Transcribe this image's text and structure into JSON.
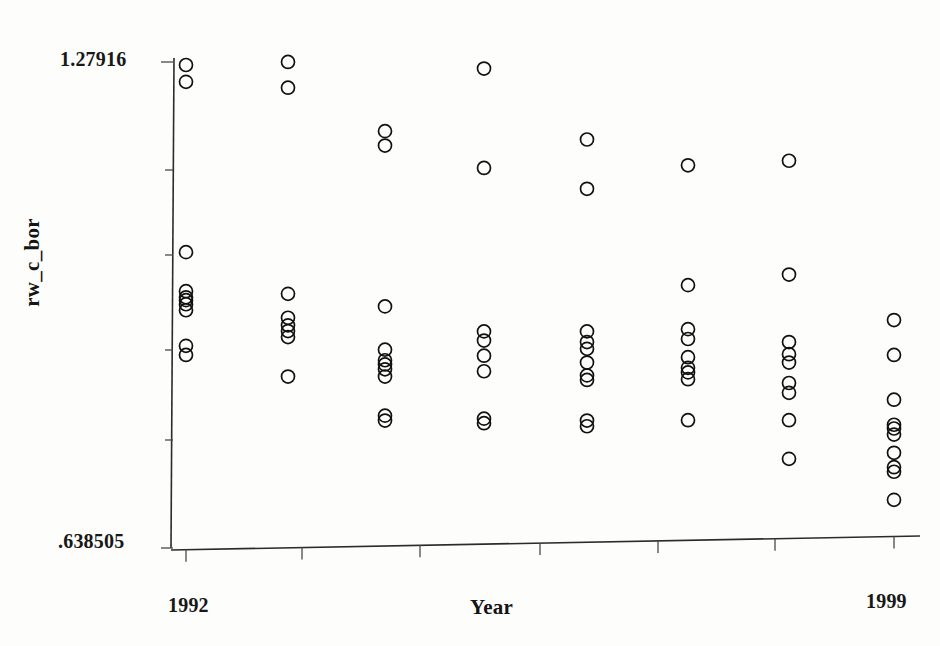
{
  "figure": {
    "kind": "scatter-strip-plot",
    "background_color": "#fdfdfb",
    "marker_color": "#111111",
    "axis_color": "#2b2b2b"
  },
  "axes": {
    "y_title": "rw_c_bor",
    "x_title": "Year",
    "y_tick_labels": [
      "1.27916",
      ".638505"
    ],
    "y_top_label": "1.27916",
    "y_bottom_label": ".638505",
    "x_tick_labels": [
      "1992",
      "1999"
    ],
    "x_left_label": "1992",
    "x_right_label": "1999"
  },
  "chart_data": {
    "type": "scatter",
    "title": "",
    "xlabel": "Year",
    "ylabel": "rw_c_bor",
    "xlim": [
      1992,
      1999
    ],
    "ylim": [
      0.638505,
      1.27916
    ],
    "grid": false,
    "legend": false,
    "x_ticks": [
      1992,
      1999
    ],
    "y_ticks": [
      0.638505,
      1.27916
    ],
    "marker": "open-circle",
    "categories": [
      "1992",
      "1993",
      "1994",
      "1995",
      "1996",
      "1997",
      "1998",
      "1999"
    ],
    "series": [
      {
        "name": "rw_c_bor",
        "points": [
          {
            "x": 1992,
            "y": 1.2752
          },
          {
            "x": 1992,
            "y": 1.253
          },
          {
            "x": 1992,
            "y": 1.0285
          },
          {
            "x": 1992,
            "y": 0.977
          },
          {
            "x": 1992,
            "y": 0.969
          },
          {
            "x": 1992,
            "y": 0.9652
          },
          {
            "x": 1992,
            "y": 0.9598
          },
          {
            "x": 1992,
            "y": 0.9519
          },
          {
            "x": 1992,
            "y": 0.905
          },
          {
            "x": 1992,
            "y": 0.893
          },
          {
            "x": 1993,
            "y": 1.2792
          },
          {
            "x": 1993,
            "y": 1.2453
          },
          {
            "x": 1993,
            "y": 0.9735
          },
          {
            "x": 1993,
            "y": 0.942
          },
          {
            "x": 1993,
            "y": 0.932
          },
          {
            "x": 1993,
            "y": 0.9245
          },
          {
            "x": 1993,
            "y": 0.9165
          },
          {
            "x": 1993,
            "y": 0.8645
          },
          {
            "x": 1994,
            "y": 1.188
          },
          {
            "x": 1994,
            "y": 1.169
          },
          {
            "x": 1994,
            "y": 0.957
          },
          {
            "x": 1994,
            "y": 0.9
          },
          {
            "x": 1994,
            "y": 0.886
          },
          {
            "x": 1994,
            "y": 0.8805
          },
          {
            "x": 1994,
            "y": 0.874
          },
          {
            "x": 1994,
            "y": 0.8645
          },
          {
            "x": 1994,
            "y": 0.813
          },
          {
            "x": 1994,
            "y": 0.8065
          },
          {
            "x": 1995,
            "y": 1.2705
          },
          {
            "x": 1995,
            "y": 1.1395
          },
          {
            "x": 1995,
            "y": 0.924
          },
          {
            "x": 1995,
            "y": 0.912
          },
          {
            "x": 1995,
            "y": 0.892
          },
          {
            "x": 1995,
            "y": 0.8715
          },
          {
            "x": 1995,
            "y": 0.809
          },
          {
            "x": 1995,
            "y": 0.803
          },
          {
            "x": 1996,
            "y": 1.177
          },
          {
            "x": 1996,
            "y": 1.112
          },
          {
            "x": 1996,
            "y": 0.924
          },
          {
            "x": 1996,
            "y": 0.91
          },
          {
            "x": 1996,
            "y": 0.901
          },
          {
            "x": 1996,
            "y": 0.883
          },
          {
            "x": 1996,
            "y": 0.866
          },
          {
            "x": 1996,
            "y": 0.86
          },
          {
            "x": 1996,
            "y": 0.8065
          },
          {
            "x": 1996,
            "y": 0.799
          },
          {
            "x": 1997,
            "y": 1.143
          },
          {
            "x": 1997,
            "y": 0.985
          },
          {
            "x": 1997,
            "y": 0.927
          },
          {
            "x": 1997,
            "y": 0.914
          },
          {
            "x": 1997,
            "y": 0.89
          },
          {
            "x": 1997,
            "y": 0.876
          },
          {
            "x": 1997,
            "y": 0.87
          },
          {
            "x": 1997,
            "y": 0.861
          },
          {
            "x": 1997,
            "y": 0.807
          },
          {
            "x": 1998,
            "y": 1.149
          },
          {
            "x": 1998,
            "y": 0.999
          },
          {
            "x": 1998,
            "y": 0.91
          },
          {
            "x": 1998,
            "y": 0.894
          },
          {
            "x": 1998,
            "y": 0.883
          },
          {
            "x": 1998,
            "y": 0.856
          },
          {
            "x": 1998,
            "y": 0.843
          },
          {
            "x": 1998,
            "y": 0.807
          },
          {
            "x": 1998,
            "y": 0.756
          },
          {
            "x": 1999,
            "y": 0.939
          },
          {
            "x": 1999,
            "y": 0.893
          },
          {
            "x": 1999,
            "y": 0.834
          },
          {
            "x": 1999,
            "y": 0.801
          },
          {
            "x": 1999,
            "y": 0.796
          },
          {
            "x": 1999,
            "y": 0.788
          },
          {
            "x": 1999,
            "y": 0.764
          },
          {
            "x": 1999,
            "y": 0.745
          },
          {
            "x": 1999,
            "y": 0.739
          },
          {
            "x": 1999,
            "y": 0.702
          }
        ]
      }
    ]
  },
  "geometry": {
    "plot_left_px": 172,
    "plot_right_px": 920,
    "plot_top_px": 62,
    "plot_bottom_px": 548,
    "x_pixel_map": {
      "1992": 186,
      "1993": 288,
      "1994": 385,
      "1995": 484,
      "1996": 587,
      "1997": 688,
      "1998": 789,
      "1999": 894
    },
    "y_axis_tick_px": [
      62,
      170,
      255,
      350,
      440,
      548
    ],
    "x_axis_tick_px": [
      186,
      302,
      420,
      540,
      658,
      775,
      894
    ],
    "marker_radius_px": 6.5
  }
}
